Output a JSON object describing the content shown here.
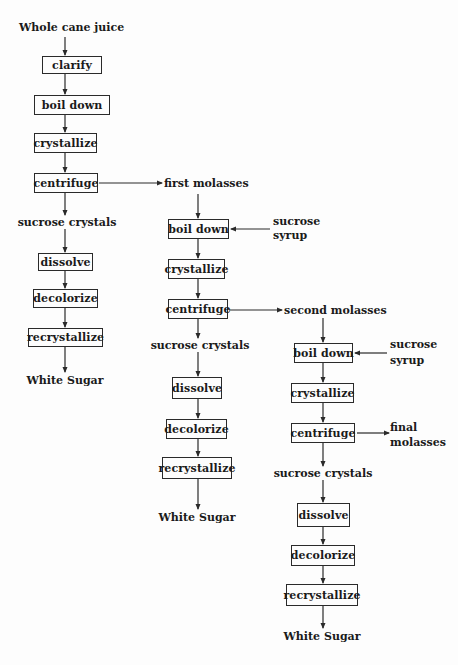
{
  "diagram": {
    "type": "flowchart",
    "start": "Whole cane juice",
    "column1": {
      "steps": [
        "clarify",
        "boil down",
        "crystallize",
        "centrifuge"
      ],
      "branch_output": "sucrose crystals",
      "refine_steps": [
        "dissolve",
        "decolorize",
        "recrystallize"
      ],
      "product": "White Sugar",
      "side_output": "first molasses"
    },
    "column2": {
      "input": "first molasses",
      "side_input": [
        "sucrose",
        "syrup"
      ],
      "steps": [
        "boil down",
        "crystallize",
        "centrifuge"
      ],
      "branch_output": "sucrose crystals",
      "refine_steps": [
        "dissolve",
        "decolorize",
        "recrystallize"
      ],
      "product": "White Sugar",
      "side_output": "second molasses"
    },
    "column3": {
      "input": "second molasses",
      "side_input": [
        "sucrose",
        "syrup"
      ],
      "steps": [
        "boil down",
        "crystallize",
        "centrifuge"
      ],
      "branch_output": "sucrose crystals",
      "refine_steps": [
        "dissolve",
        "decolorize",
        "recrystallize"
      ],
      "product": "White Sugar",
      "side_output": [
        "final",
        "molasses"
      ]
    }
  }
}
